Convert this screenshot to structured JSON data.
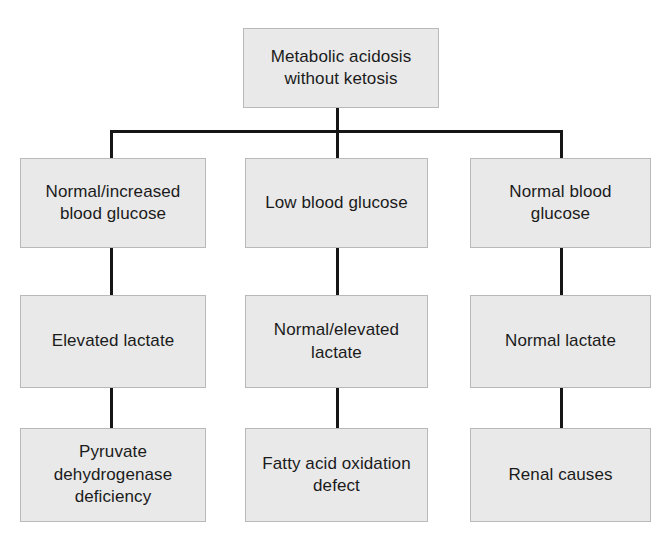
{
  "diagram": {
    "type": "flowchart",
    "orientation": "top-down",
    "style": {
      "node_fill": "#e9e9e9",
      "node_border": "#b9b9b9",
      "connector_color": "#161616",
      "text_color": "#1b1b1b",
      "background": "#ffffff"
    },
    "root": {
      "id": "root",
      "label": "Metabolic acidosis\nwithout ketosis"
    },
    "branches": [
      {
        "id": "branch-left",
        "level1": {
          "id": "left-glucose",
          "label": "Normal/increased\nblood glucose"
        },
        "level2": {
          "id": "left-lactate",
          "label": "Elevated lactate"
        },
        "level3": {
          "id": "left-diagnosis",
          "label": "Pyruvate\ndehydrogenase\ndeficiency"
        }
      },
      {
        "id": "branch-middle",
        "level1": {
          "id": "middle-glucose",
          "label": "Low blood glucose"
        },
        "level2": {
          "id": "middle-lactate",
          "label": "Normal/elevated\nlactate"
        },
        "level3": {
          "id": "middle-diagnosis",
          "label": "Fatty acid oxidation\ndefect"
        }
      },
      {
        "id": "branch-right",
        "level1": {
          "id": "right-glucose",
          "label": "Normal blood\nglucose"
        },
        "level2": {
          "id": "right-lactate",
          "label": "Normal lactate"
        },
        "level3": {
          "id": "right-diagnosis",
          "label": "Renal causes"
        }
      }
    ]
  }
}
